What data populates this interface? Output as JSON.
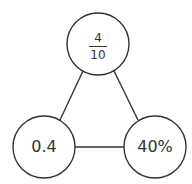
{
  "diagram": {
    "type": "triangle-of-equivalent-values",
    "colors": {
      "stroke": "#333333",
      "text": "#333333",
      "background": "#ffffff"
    },
    "nodes": [
      {
        "id": "top",
        "kind": "fraction",
        "numerator": "4",
        "denominator": "10",
        "cx": 98,
        "cy": 44,
        "r": 31
      },
      {
        "id": "bottom-left",
        "kind": "decimal",
        "label": "0.4",
        "cx": 44,
        "cy": 147,
        "r": 31
      },
      {
        "id": "bottom-right",
        "kind": "percent",
        "label": "40%",
        "cx": 155,
        "cy": 147,
        "r": 31
      }
    ],
    "edges": [
      {
        "from": "top",
        "to": "bottom-left"
      },
      {
        "from": "top",
        "to": "bottom-right"
      },
      {
        "from": "bottom-left",
        "to": "bottom-right"
      }
    ]
  }
}
